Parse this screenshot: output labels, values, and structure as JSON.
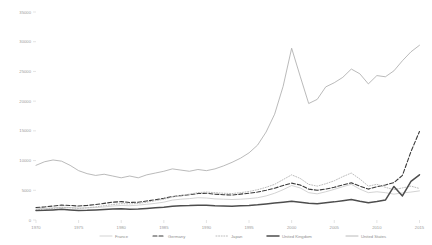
{
  "chart_data": {
    "type": "line",
    "title": "",
    "subtitle": "",
    "xlabel": "",
    "ylabel": "",
    "xlim": [
      1970,
      2016
    ],
    "ylim": [
      0,
      35000
    ],
    "grid": false,
    "legend_position": "bottom",
    "xticks": [
      "1970",
      "1975",
      "1980",
      "1985",
      "1990",
      "1995",
      "2000",
      "2005",
      "2010",
      "2015"
    ],
    "yticks": [
      "0",
      "5000",
      "10000",
      "15000",
      "20000",
      "25000",
      "30000",
      "35000"
    ],
    "ytick_values": [
      0,
      5000,
      10000,
      15000,
      20000,
      25000,
      30000,
      35000
    ],
    "x": [
      1970,
      1971,
      1972,
      1973,
      1974,
      1975,
      1976,
      1977,
      1978,
      1979,
      1980,
      1981,
      1982,
      1983,
      1984,
      1985,
      1986,
      1987,
      1988,
      1989,
      1990,
      1991,
      1992,
      1993,
      1994,
      1995,
      1996,
      1997,
      1998,
      1999,
      2000,
      2001,
      2002,
      2003,
      2004,
      2005,
      2006,
      2007,
      2008,
      2009,
      2010,
      2011,
      2012,
      2013,
      2014,
      2015
    ],
    "series": [
      {
        "name": "France",
        "color": "#c8c8c8",
        "style": "solid-light",
        "stroke_width": 0.8,
        "dash": "none",
        "values": [
          1900,
          1950,
          2050,
          2150,
          2100,
          2000,
          2050,
          2100,
          2200,
          2350,
          2450,
          2400,
          2500,
          2650,
          2800,
          3000,
          3350,
          3500,
          3600,
          3750,
          3700,
          3550,
          3500,
          3450,
          3500,
          3600,
          3750,
          4050,
          4500,
          5100,
          5800,
          5400,
          4600,
          4400,
          4750,
          5150,
          5600,
          6000,
          5200,
          4600,
          4750,
          4600,
          4350,
          4550,
          4700,
          4900
        ]
      },
      {
        "name": "Germany",
        "color": "#3a3a3a",
        "style": "dashed",
        "stroke_width": 1.1,
        "dash": "4,2",
        "values": [
          2100,
          2200,
          2350,
          2500,
          2450,
          2350,
          2450,
          2600,
          2800,
          3000,
          3100,
          2950,
          3000,
          3200,
          3400,
          3650,
          3950,
          4100,
          4250,
          4450,
          4500,
          4350,
          4250,
          4200,
          4350,
          4500,
          4700,
          5000,
          5350,
          5800,
          6200,
          5900,
          5200,
          5000,
          5200,
          5500,
          5900,
          6250,
          5700,
          5200,
          5600,
          5900,
          6300,
          7500,
          11500,
          14900
        ]
      },
      {
        "name": "Japan",
        "color": "#b4b4b4",
        "style": "dotted",
        "stroke_width": 0.9,
        "dash": "1,1.6",
        "values": [
          1700,
          1800,
          1950,
          2100,
          2050,
          1950,
          2050,
          2200,
          2400,
          2600,
          2750,
          2700,
          2800,
          3000,
          3250,
          3500,
          3850,
          4100,
          4350,
          4600,
          4700,
          4600,
          4500,
          4450,
          4600,
          4800,
          5100,
          5500,
          6000,
          6800,
          7600,
          7000,
          6000,
          5700,
          6100,
          6600,
          7300,
          7900,
          6900,
          5700,
          6000,
          5500,
          5100,
          5400,
          5700,
          5300
        ]
      },
      {
        "name": "United Kingdom",
        "color": "#4d4d4d",
        "style": "solid-thick",
        "stroke_width": 1.5,
        "dash": "none",
        "values": [
          1600,
          1620,
          1700,
          1800,
          1700,
          1600,
          1620,
          1680,
          1750,
          1850,
          1900,
          1820,
          1850,
          1950,
          2050,
          2150,
          2300,
          2380,
          2420,
          2500,
          2480,
          2400,
          2350,
          2330,
          2400,
          2450,
          2550,
          2700,
          2850,
          3000,
          3150,
          3000,
          2800,
          2750,
          2900,
          3050,
          3250,
          3450,
          3150,
          2900,
          3100,
          3350,
          5650,
          4050,
          6500,
          7600
        ]
      },
      {
        "name": "United States",
        "color": "#a8a8a8",
        "style": "solid-thin",
        "stroke_width": 0.8,
        "dash": "none",
        "values": [
          9200,
          9800,
          10100,
          9900,
          9200,
          8300,
          7800,
          7500,
          7700,
          7400,
          7100,
          7400,
          7100,
          7600,
          7900,
          8200,
          8600,
          8400,
          8200,
          8500,
          8300,
          8600,
          9100,
          9700,
          10400,
          11300,
          12600,
          14800,
          17800,
          22500,
          28900,
          24200,
          19600,
          20300,
          22400,
          23100,
          24000,
          25400,
          24600,
          22900,
          24300,
          24100,
          25100,
          26800,
          28300,
          29400
        ]
      }
    ]
  },
  "legend": {
    "items": [
      {
        "label": "France"
      },
      {
        "label": "Germany"
      },
      {
        "label": "Japan"
      },
      {
        "label": "United Kingdom"
      },
      {
        "label": "United States"
      }
    ]
  }
}
